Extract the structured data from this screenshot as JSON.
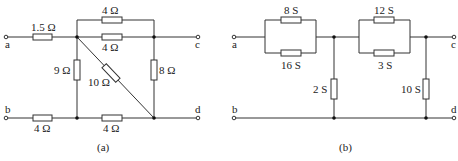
{
  "circuit_a": {
    "caption": "(a)",
    "terminals": {
      "a": "a",
      "b": "b",
      "c": "c",
      "d": "d"
    },
    "resistors": {
      "r_series_a": "1.5 Ω",
      "r_top_outer": "4 Ω",
      "r_top_inner": "4 Ω",
      "r_vertical_left": "9 Ω",
      "r_diagonal": "10 Ω",
      "r_vertical_right": "8 Ω",
      "r_bottom_left": "4 Ω",
      "r_bottom_right": "4 Ω"
    }
  },
  "circuit_b": {
    "caption": "(b)",
    "terminals": {
      "a": "a",
      "b": "b",
      "c": "c",
      "d": "d"
    },
    "conductances": {
      "g_par1_top": "8 S",
      "g_par1_bottom": "16 S",
      "g_par2_top": "12 S",
      "g_par2_bottom": "3 S",
      "g_shunt_left": "2 S",
      "g_shunt_right": "10 S"
    }
  }
}
